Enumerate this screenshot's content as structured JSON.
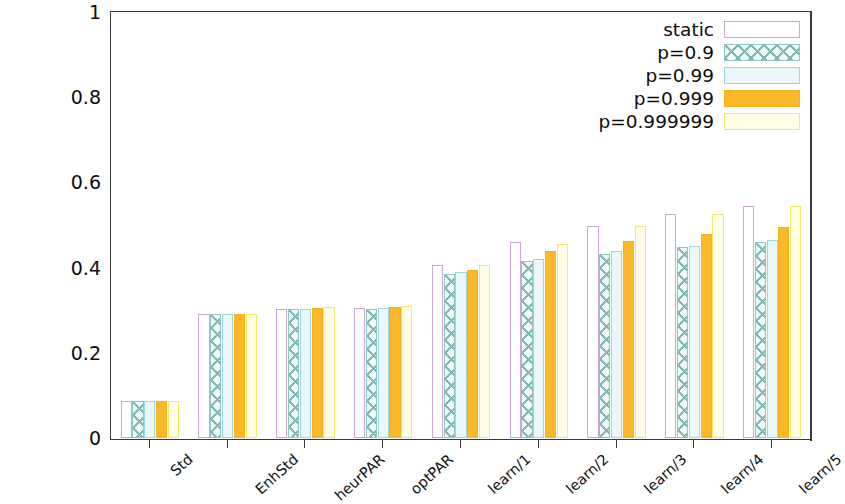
{
  "chart_data": {
    "type": "bar",
    "title": "",
    "xlabel": "",
    "ylabel": "Avg. fraction of fully successful rounds",
    "ylim": [
      0,
      1
    ],
    "yticks": [
      "0",
      "0.2",
      "0.4",
      "0.6",
      "0.8",
      "1"
    ],
    "ytick_values": [
      0,
      0.2,
      0.4,
      0.6,
      0.8,
      1
    ],
    "grid": false,
    "legend_position": "top-right",
    "categories": [
      "Std",
      "EnhStd",
      "heurPAR",
      "optPAR",
      "learn/1",
      "learn/2",
      "learn/3",
      "learn/4",
      "learn/5"
    ],
    "series": [
      {
        "name": "static",
        "color": "#c9a8d8",
        "fill": "open",
        "values": [
          0.088,
          0.292,
          0.303,
          0.306,
          0.405,
          0.46,
          0.498,
          0.525,
          0.545
        ]
      },
      {
        "name": "p=0.9",
        "color": "#7fb8b4",
        "fill": "cross-hatch",
        "values": [
          0.088,
          0.292,
          0.302,
          0.303,
          0.385,
          0.415,
          0.432,
          0.448,
          0.46
        ]
      },
      {
        "name": "p=0.99",
        "color": "#9fd6e6",
        "fill": "light",
        "values": [
          0.088,
          0.292,
          0.303,
          0.305,
          0.39,
          0.42,
          0.44,
          0.45,
          0.465
        ]
      },
      {
        "name": "p=0.999",
        "color": "#fbb829",
        "fill": "solid",
        "values": [
          0.088,
          0.292,
          0.306,
          0.308,
          0.395,
          0.44,
          0.463,
          0.478,
          0.495
        ]
      },
      {
        "name": "p=0.999999",
        "color": "#f3e96a",
        "fill": "pale",
        "values": [
          0.088,
          0.292,
          0.307,
          0.31,
          0.405,
          0.455,
          0.498,
          0.525,
          0.545
        ]
      }
    ]
  },
  "legend": {
    "items": [
      {
        "label": "static"
      },
      {
        "label": "p=0.9"
      },
      {
        "label": "p=0.99"
      },
      {
        "label": "p=0.999"
      },
      {
        "label": "p=0.999999"
      }
    ]
  }
}
